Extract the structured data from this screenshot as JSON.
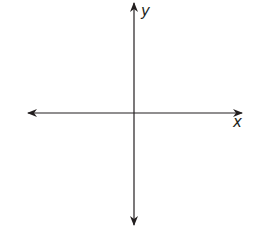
{
  "diagram": {
    "type": "coordinate-plane",
    "x_axis_label": "x",
    "y_axis_label": "y",
    "line_color": "#231f20",
    "origin": {
      "x": 134,
      "y": 113
    },
    "x_axis": {
      "x1": 27,
      "x2": 243
    },
    "y_axis": {
      "y1": 2,
      "y2": 226
    }
  }
}
